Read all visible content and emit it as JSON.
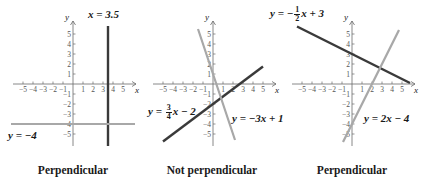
{
  "colors": {
    "axis": "#6b6b6b",
    "dark_line": "#3a3a3a",
    "light_line": "#a8a8a8",
    "text": "#1a1a1a"
  },
  "axes": {
    "x_label": "x",
    "y_label": "y",
    "x_ticks": [
      -5,
      -4,
      -3,
      -2,
      -1,
      1,
      2,
      3,
      4,
      5
    ],
    "y_ticks": [
      -5,
      -4,
      -3,
      -2,
      -1,
      1,
      2,
      3,
      4,
      5
    ]
  },
  "graphs": [
    {
      "id": "graph-1",
      "origin_px": [
        73,
        84
      ],
      "unit_px": 10,
      "caption": "Perpendicular",
      "lines": [
        {
          "equation": "x = 3.5",
          "type": "vertical",
          "x": 3.5,
          "tone": "dark"
        },
        {
          "equation": "y = −4",
          "type": "horizontal",
          "y": -4,
          "tone": "light"
        }
      ],
      "labels": {
        "line1": "x = 3.5",
        "line2": "y = −4"
      }
    },
    {
      "id": "graph-2",
      "origin_px": [
        213,
        84
      ],
      "unit_px": 10,
      "caption": "Not perpendicular",
      "lines": [
        {
          "equation": "y = (3/4)x − 2",
          "slope": 0.75,
          "intercept": -2,
          "x_range": [
            -5,
            5
          ],
          "tone": "dark"
        },
        {
          "equation": "y = −3x + 1",
          "slope": -3,
          "intercept": 1,
          "x_range": [
            -1.5,
            2.2
          ],
          "tone": "light"
        }
      ],
      "labels": {
        "line1_prefix": "y = ",
        "line1_num": "3",
        "line1_den": "4",
        "line1_suffix": "x − 2",
        "line2": "y = −3x + 1"
      }
    },
    {
      "id": "graph-3",
      "origin_px": [
        352,
        84
      ],
      "unit_px": 10,
      "caption": "Perpendicular",
      "lines": [
        {
          "equation": "y = −(1/2)x + 3",
          "slope": -0.5,
          "intercept": 3,
          "x_range": [
            -5.5,
            5.8
          ],
          "tone": "dark"
        },
        {
          "equation": "y = 2x − 4",
          "slope": 2,
          "intercept": -4,
          "x_range": [
            -0.9,
            4.7
          ],
          "tone": "light"
        }
      ],
      "labels": {
        "line1_prefix": "y = −",
        "line1_num": "1",
        "line1_den": "2",
        "line1_suffix": "x + 3",
        "line2": "y = 2x − 4"
      }
    }
  ]
}
